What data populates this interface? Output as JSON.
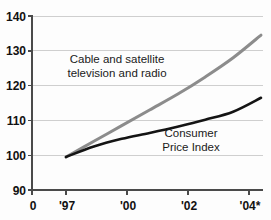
{
  "chart_data": {
    "type": "line",
    "title": "",
    "subtitle": "",
    "xlabel": "",
    "ylabel": "",
    "grid": "horizontal",
    "legend_position": "inline-annotation",
    "ylim": [
      90,
      140
    ],
    "ytick_labels": [
      "140",
      "130",
      "120",
      "110",
      "100",
      "90"
    ],
    "ytick_values": [
      140,
      130,
      120,
      110,
      100,
      90
    ],
    "xtick_labels": [
      "0",
      "'97",
      "'00",
      "'02",
      "'04*"
    ],
    "xtick_positions": [
      0,
      1,
      2,
      3,
      4
    ],
    "origin_label": "0",
    "x": [
      "'97",
      "'98",
      "'99",
      "'00",
      "'01",
      "'02",
      "'03",
      "'04*"
    ],
    "series": [
      {
        "name": "Cable and satellite television and radio",
        "color": "#8c8c8c",
        "values": [
          99.5,
          104.0,
          108.5,
          113.0,
          117.5,
          122.5,
          128.0,
          134.5
        ],
        "annotation": {
          "line1": "Cable and satellite",
          "line2": "television and radio"
        }
      },
      {
        "name": "Consumer Price Index",
        "color": "#141414",
        "values": [
          99.5,
          102.5,
          104.7,
          106.4,
          108.2,
          110.2,
          112.5,
          116.5
        ],
        "annotation": {
          "line1": "Consumer",
          "line2": "Price Index"
        }
      }
    ]
  },
  "colors": {
    "cable_line": "#8c8c8c",
    "cpi_line": "#141414",
    "axis": "#4a4a4a",
    "grid": "#cfcfcf",
    "background": "#fdfdfd",
    "text": "#111111"
  }
}
